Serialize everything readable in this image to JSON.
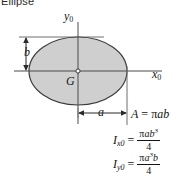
{
  "figure": {
    "caption": "Ellipse",
    "background_color": "#ffffff",
    "shape_fill_color": "#cfcfcf",
    "shape_stroke_color": "#3c3c3c",
    "axis_color": "#4a4a4a"
  },
  "axes": {
    "y_axis_label": "y",
    "y_axis_subscript": "0",
    "x_axis_label": "x",
    "x_axis_subscript": "0"
  },
  "annotations": {
    "centroid_label": "G",
    "semi_minor_label": "b",
    "semi_major_label": "a"
  },
  "formulas": {
    "area": {
      "lhs": "A",
      "equals": "=",
      "rhs_pi": "π",
      "rhs_rest": "ab"
    },
    "ixo": {
      "symbol": "I",
      "subscript": "x0",
      "equals": "=",
      "numerator_pi": "π",
      "numerator_base": "ab",
      "numerator_exp": "3",
      "denominator": "4"
    },
    "iyo": {
      "symbol": "I",
      "subscript": "y0",
      "equals": "=",
      "numerator_pi": "π",
      "numerator_base1": "a",
      "numerator_exp": "3",
      "numerator_base2": "b",
      "denominator": "4"
    }
  },
  "geometry": {
    "center_x": 78,
    "center_y": 71,
    "semi_major_px": 49,
    "semi_minor_px": 34
  }
}
